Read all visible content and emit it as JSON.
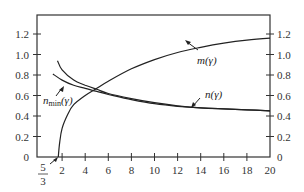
{
  "chart_data": {
    "type": "line",
    "title": "",
    "xlabel": "",
    "ylabel": "",
    "xlim": [
      0,
      20
    ],
    "ylim": [
      0,
      1.3
    ],
    "grid": false,
    "x_ticks": [
      "5/3",
      "2",
      "4",
      "6",
      "8",
      "10",
      "12",
      "14",
      "16",
      "18",
      "20"
    ],
    "y_ticks_left": [
      "0",
      "0.2",
      "0.4",
      "0.6",
      "0.8",
      "1.0",
      "1.2"
    ],
    "y_ticks_right": [
      "0",
      "0.2",
      "0.4",
      "0.6",
      "0.8",
      "1.0",
      "1.2"
    ],
    "series": [
      {
        "name": "m(γ)",
        "x": [
          1.667,
          1.8,
          2,
          2.5,
          3,
          4,
          5,
          6,
          8,
          10,
          12,
          14,
          16,
          18,
          20
        ],
        "values": [
          0.0,
          0.15,
          0.28,
          0.42,
          0.51,
          0.6,
          0.67,
          0.74,
          0.86,
          0.95,
          1.02,
          1.07,
          1.11,
          1.14,
          1.16
        ]
      },
      {
        "name": "n(γ)",
        "x": [
          1.6,
          2,
          3,
          4,
          5,
          6,
          8,
          10,
          12,
          14,
          16,
          18,
          20
        ],
        "values": [
          0.94,
          0.85,
          0.75,
          0.7,
          0.66,
          0.62,
          0.57,
          0.53,
          0.5,
          0.48,
          0.47,
          0.46,
          0.45
        ]
      },
      {
        "name": "n_min(γ)",
        "x": [
          1.2,
          2,
          3,
          4,
          5,
          6,
          8,
          10,
          12,
          14,
          16,
          18,
          20
        ],
        "values": [
          0.81,
          0.75,
          0.7,
          0.67,
          0.64,
          0.61,
          0.56,
          0.52,
          0.495,
          0.48,
          0.47,
          0.46,
          0.45
        ]
      }
    ],
    "annotations": [
      {
        "text": "m(γ)",
        "points_to": "m curve near γ=12"
      },
      {
        "text": "n(γ)",
        "points_to": "n curve near γ=13"
      },
      {
        "text": "n_min(γ)",
        "points_to": "n_min curve near γ=3"
      },
      {
        "text": "5/3",
        "points_to": "x-intercept of m curve"
      }
    ]
  },
  "labels": {
    "m": "m(γ)",
    "n": "n(γ)",
    "nmin_base": "n",
    "nmin_sub": "min",
    "nmin_arg": "(γ)",
    "five": "5",
    "three": "3"
  }
}
